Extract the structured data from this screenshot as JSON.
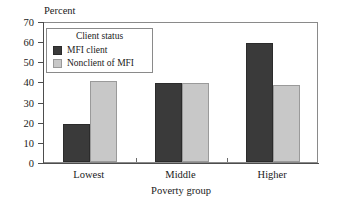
{
  "chart_data": {
    "type": "bar",
    "title": "",
    "ylabel": "Percent",
    "xlabel": "Poverty group",
    "categories": [
      "Lowest",
      "Middle",
      "Higher"
    ],
    "series": [
      {
        "name": "MFI client",
        "values": [
          19,
          39,
          59
        ],
        "color": "#3a3a3a"
      },
      {
        "name": "Nonclient of MFI",
        "values": [
          40,
          39,
          38
        ],
        "color": "#c8c8c8"
      }
    ],
    "ylim": [
      0,
      70
    ],
    "yticks": [
      0,
      10,
      20,
      30,
      40,
      50,
      60,
      70
    ],
    "ytick_labels": [
      "0",
      "10",
      "20",
      "30",
      "40",
      "50",
      "60",
      "70"
    ],
    "grid": false,
    "legend": {
      "position": "upper-left-inside",
      "title": "Client status",
      "entries": [
        "MFI client",
        "Nonclient of MFI"
      ]
    }
  }
}
